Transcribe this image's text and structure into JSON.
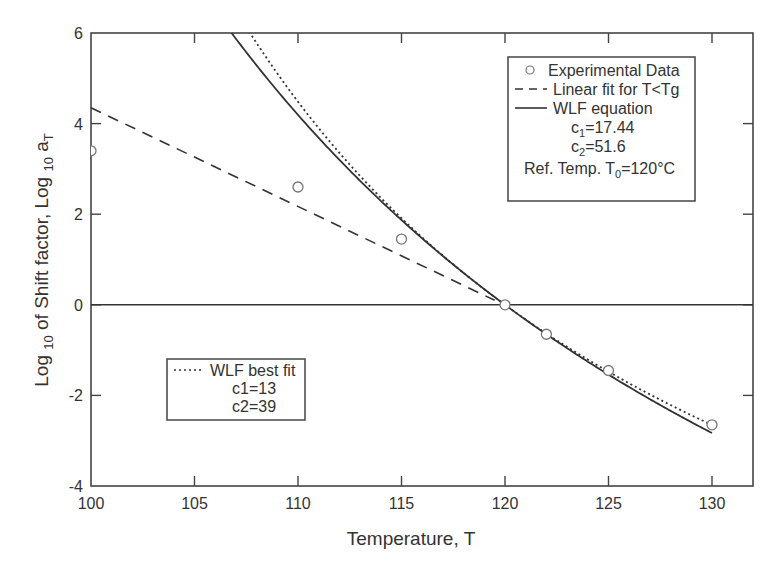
{
  "chart_data": {
    "type": "line",
    "title": "",
    "xlabel": "Temperature, T",
    "ylabel": "Log 10 of Shift factor, Log 10 aT",
    "ylabel_parts": {
      "a": "Log ",
      "sub1": "10",
      "b": " of Shift factor, Log ",
      "sub2": "10",
      "c": " a",
      "sub3": "T"
    },
    "xlim": [
      100,
      132
    ],
    "ylim": [
      -4,
      6
    ],
    "xticks": [
      100,
      105,
      110,
      115,
      120,
      125,
      130
    ],
    "yticks": [
      -4,
      -2,
      0,
      2,
      4,
      6
    ],
    "grid": false,
    "reference_line_y": 0,
    "series": [
      {
        "name": "Experimental Data",
        "style": "circle-markers",
        "x": [
          100,
          110,
          115,
          120,
          122,
          125,
          130
        ],
        "y": [
          3.4,
          2.6,
          1.45,
          0.0,
          -0.65,
          -1.45,
          -2.65
        ]
      },
      {
        "name": "Linear fit for T<Tg",
        "style": "dashed",
        "x": [
          100,
          119.5
        ],
        "y": [
          4.35,
          0.1
        ]
      },
      {
        "name": "WLF equation",
        "style": "solid",
        "c1": 17.44,
        "c2": 51.6,
        "T0": 120,
        "x_range": [
          106.7,
          130
        ]
      },
      {
        "name": "WLF best fit",
        "style": "dotted",
        "c1": 13,
        "c2": 39,
        "T0": 120,
        "x_range": [
          108.0,
          130
        ]
      }
    ],
    "legend_main": {
      "position": "upper right",
      "entries": [
        {
          "symbol": "circle",
          "label": "Experimental Data"
        },
        {
          "symbol": "dashed",
          "label": "Linear fit for T<Tg"
        },
        {
          "symbol": "solid",
          "label": "WLF equation"
        }
      ],
      "params": [
        {
          "base": "c",
          "sub": "1",
          "rest": "=17.44"
        },
        {
          "base": "c",
          "sub": "2",
          "rest": "=51.6"
        },
        {
          "base": "Ref. Temp. T",
          "sub": "0",
          "rest": "=120°C"
        }
      ]
    },
    "legend_secondary": {
      "position": "lower left",
      "entries": [
        {
          "symbol": "dotted",
          "label": "WLF best fit"
        }
      ],
      "params": [
        "c1=13",
        "c2=39"
      ]
    },
    "colors": {
      "line": "#333333",
      "marker": "#777777",
      "axis": "#444444"
    }
  }
}
